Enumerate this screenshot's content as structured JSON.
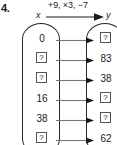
{
  "problem": {
    "number": "4.",
    "rule": "+9, ×3, −7",
    "input_label": "x",
    "output_label": "y",
    "unknown_symbol": "?",
    "arrow_icon": "right-arrow-icon"
  },
  "mapping": {
    "input_header": "x",
    "output_header": "y",
    "rows": [
      {
        "x": "0",
        "y": "?",
        "x_unknown": false,
        "y_unknown": true
      },
      {
        "x": "?",
        "y": "83",
        "x_unknown": true,
        "y_unknown": false
      },
      {
        "x": "?",
        "y": "38",
        "x_unknown": true,
        "y_unknown": false
      },
      {
        "x": "16",
        "y": "?",
        "x_unknown": false,
        "y_unknown": true
      },
      {
        "x": "38",
        "y": "?",
        "x_unknown": false,
        "y_unknown": true
      },
      {
        "x": "?",
        "y": "62",
        "x_unknown": true,
        "y_unknown": false
      }
    ]
  },
  "colors": {
    "ink": "#1a1a1a",
    "outline": "#2b2b2b",
    "box_border": "#555555",
    "connector": "#777777",
    "background": "#ffffff"
  }
}
